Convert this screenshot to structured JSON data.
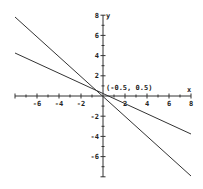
{
  "chart_data": {
    "type": "line",
    "title": "",
    "xlabel": "x",
    "ylabel": "y",
    "xlim": [
      -8,
      8
    ],
    "ylim": [
      -8,
      8
    ],
    "x_ticks": [
      -6,
      -4,
      -2,
      2,
      4,
      6,
      8
    ],
    "y_ticks": [
      8,
      6,
      4,
      2,
      -2,
      -4,
      -6
    ],
    "grid": false,
    "series": [
      {
        "name": "line-steep",
        "slope": -1,
        "intercept": 0,
        "x": [
          -8,
          8
        ],
        "y": [
          8,
          -8
        ]
      },
      {
        "name": "line-shallow",
        "slope": -0.5,
        "intercept": 0.25,
        "x": [
          -8,
          8
        ],
        "y": [
          4.25,
          -3.75
        ]
      }
    ],
    "annotations": [
      {
        "text": "(-0.5, 0.5)",
        "x": -0.5,
        "y": 0.5
      }
    ]
  },
  "labels": {
    "x_axis": "x",
    "y_axis": "y",
    "point": "(-0.5, 0.5)",
    "xt": [
      "-6",
      "-4",
      "-2",
      "2",
      "4",
      "6",
      "8"
    ],
    "yt": [
      "8",
      "6",
      "4",
      "2",
      "-2",
      "-4",
      "-6"
    ]
  }
}
